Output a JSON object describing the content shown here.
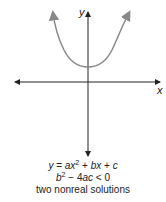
{
  "diagram": {
    "axes": {
      "x_label": "x",
      "y_label": "y"
    },
    "curve": {
      "type": "parabola",
      "opens": "up",
      "vertex_above_x_axis": true,
      "color": "#888888"
    },
    "equation": {
      "lhs": "y",
      "equals": "=",
      "a": "a",
      "x": "x",
      "exp": "2",
      "plus1": "+",
      "bx": "bx",
      "plus2": "+",
      "c": "c"
    },
    "discriminant": {
      "b": "b",
      "exp": "2",
      "rest_op": "−",
      "four": "4",
      "ac": "ac",
      "rel": "< 0"
    },
    "solutions_text": "two nonreal solutions"
  }
}
